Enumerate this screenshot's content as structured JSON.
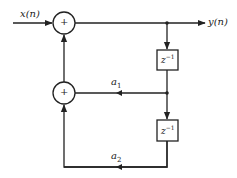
{
  "diagram": {
    "type": "block-diagram",
    "input_label": "x(n)",
    "output_label": "y(n)",
    "adders": [
      {
        "id": "adder-top",
        "symbol": "+"
      },
      {
        "id": "adder-bottom",
        "symbol": "+"
      }
    ],
    "delays": [
      {
        "id": "delay-1",
        "label": "z",
        "exp": "−1"
      },
      {
        "id": "delay-2",
        "label": "z",
        "exp": "−1"
      }
    ],
    "coefficients": [
      {
        "id": "coef-a1",
        "label": "a",
        "sub": "1"
      },
      {
        "id": "coef-a2",
        "label": "a",
        "sub": "2"
      }
    ],
    "colors": {
      "stroke": "#222222",
      "background": "#ffffff"
    }
  }
}
